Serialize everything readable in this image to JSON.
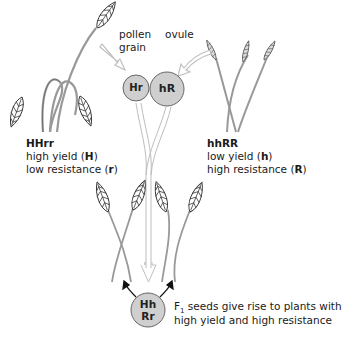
{
  "labels": {
    "pollen": "pollen",
    "grain": "grain",
    "ovule": "ovule"
  },
  "parent_left": {
    "genotype": "HHrr",
    "line1_prefix": "high yield (",
    "line1_allele": "H",
    "line1_suffix": ")",
    "line2_prefix": "low resistance (",
    "line2_allele": "r",
    "line2_suffix": ")"
  },
  "parent_right": {
    "genotype": "hhRR",
    "line1_prefix": "low yield (",
    "line1_allele": "h",
    "line1_suffix": ")",
    "line2_prefix": "high resistance (",
    "line2_allele": "R",
    "line2_suffix": ")"
  },
  "gametes": {
    "pollen": "Hr",
    "ovule": "hR"
  },
  "offspring": {
    "line1": "Hh",
    "line2": "Rr",
    "caption_F": "F",
    "caption_sub": "1",
    "caption_line1_rest": " seeds give rise to plants with",
    "caption_line2": "high yield and high resistance"
  },
  "colors": {
    "circle_fill": "#cfcfcf",
    "circle_stroke": "#666666",
    "arrow_light": "#c8c8c8",
    "stem": "#888888",
    "text": "#1a1a1a"
  }
}
